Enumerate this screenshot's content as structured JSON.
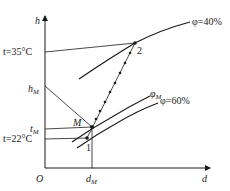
{
  "diagram": {
    "type": "psychrometric h-d chart (mixing process)",
    "axes": {
      "y_label": "h",
      "x_label": "d",
      "origin_label": "O"
    },
    "temperature_labels": {
      "t_high": "t=35°C",
      "t_mix": "t",
      "t_mix_sub": "M",
      "t_low": "t=22°C"
    },
    "enthalpy_label": {
      "main": "h",
      "sub": "M"
    },
    "moisture_label": {
      "main": "d",
      "sub": "M"
    },
    "points": {
      "p1": "1",
      "p2": "2",
      "mix": "M"
    },
    "curves": {
      "phi40": "φ=40%",
      "phiM_main": "φ",
      "phiM_sub": "M",
      "phi60": "φ=60%"
    },
    "colors": {
      "line": "#1a1a1a",
      "text": "#222222",
      "background": "#ffffff"
    }
  }
}
